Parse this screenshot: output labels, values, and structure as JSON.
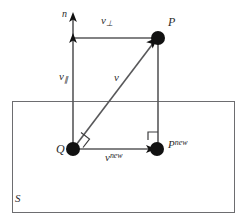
{
  "figure": {
    "background_color": "#ffffff",
    "line_color": "#58585a",
    "dot_color": "#111111",
    "text_color": "#2b2b2b",
    "width": 248,
    "height": 222
  },
  "labels": {
    "normal": "n",
    "v_perp_base": "v",
    "v_perp_sub": "⊥",
    "v_par_base": "v",
    "v_par_sub": "∥",
    "v": "v",
    "point_p": "P",
    "point_q": "Q",
    "point_p_new_base": "P",
    "point_p_new_sup": "new",
    "v_new_base": "v",
    "v_new_sup": "new",
    "surface": "S"
  },
  "geometry": {
    "plane_rect": {
      "x": 12,
      "y": 101,
      "width": 223,
      "height": 112
    },
    "points": {
      "P": {
        "x": 158,
        "y": 38,
        "radius": 7
      },
      "Q": {
        "x": 73,
        "y": 149,
        "radius": 7
      },
      "Pnew": {
        "x": 157,
        "y": 149,
        "radius": 7
      }
    },
    "normal_axis": {
      "x": 73,
      "top": 14,
      "bottom": 149
    },
    "v_perp_line": {
      "y": 38,
      "from_x": 73,
      "to_x": 158
    },
    "p_drop_line": {
      "x": 158,
      "from_y": 38,
      "to_y": 149
    },
    "v_new_line": {
      "y": 149,
      "from_x": 73,
      "to_x": 157
    },
    "v_line": {
      "x1": 73,
      "y1": 149,
      "x2": 158,
      "y2": 38
    },
    "right_angle_markers": [
      {
        "at": "Q",
        "x": 73,
        "y": 149
      },
      {
        "at": "Pnew",
        "x": 157,
        "y": 149
      }
    ]
  }
}
